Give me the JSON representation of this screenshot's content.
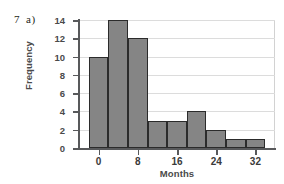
{
  "question": {
    "number": "7",
    "part": "a)"
  },
  "chart_data": {
    "type": "bar",
    "title": "",
    "xlabel": "Months",
    "ylabel": "Frequency",
    "bin_width": 4,
    "bin_starts": [
      -2,
      2,
      6,
      10,
      14,
      18,
      22,
      26,
      30
    ],
    "categories": [
      "-2 to 2",
      "2 to 6",
      "6 to 10",
      "10 to 14",
      "14 to 18",
      "18 to 22",
      "22 to 26",
      "26 to 30",
      "30 to 34"
    ],
    "values": [
      10,
      14,
      12,
      3,
      3,
      4,
      2,
      1,
      1
    ],
    "xlim": [
      -4,
      36
    ],
    "ylim": [
      0,
      14
    ],
    "x_ticks": [
      0,
      8,
      16,
      24,
      32
    ],
    "x_tick_labels": [
      "0",
      "8",
      "16",
      "24",
      "32"
    ],
    "y_ticks": [
      0,
      2,
      4,
      6,
      8,
      10,
      12,
      14
    ],
    "y_tick_labels": [
      "0",
      "2",
      "4",
      "6",
      "8",
      "10",
      "12",
      "14"
    ],
    "grid": "horizontal",
    "legend": "none",
    "bar_fill_color": "#858585",
    "bar_edge_color": "#2b2b2b",
    "gridline_color": "#dcdcdc",
    "axis_color": "#58595b"
  }
}
